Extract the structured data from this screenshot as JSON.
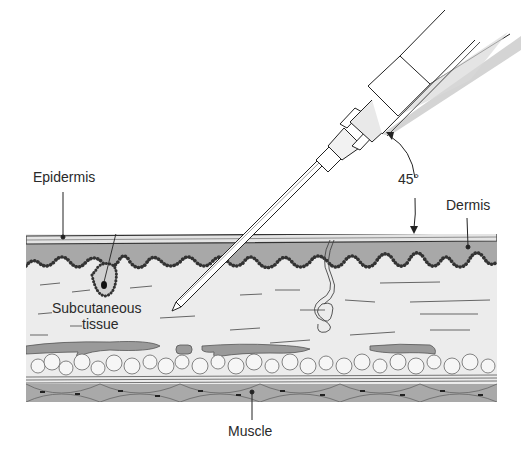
{
  "figure": {
    "angle_label": "45°",
    "colors": {
      "background": "#ffffff",
      "epidermis": "#e6e6e6",
      "dermis": "#a8a8a8",
      "subcutaneous": "#ececec",
      "fat": "#f4f4f4",
      "vessel": "#9a9a9a",
      "muscle": "#a9a9a9",
      "line": "#333333",
      "text": "#2a2a2a"
    }
  },
  "labels": {
    "epidermis": "Epidermis",
    "dermis": "Dermis",
    "subcutaneous_line1": "Subcutaneous",
    "subcutaneous_line2": "tissue",
    "muscle": "Muscle",
    "angle": "45°"
  }
}
